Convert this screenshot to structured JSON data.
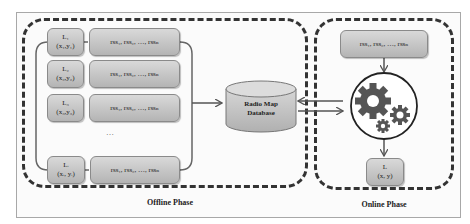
{
  "offline": {
    "label": "Offline Phase",
    "rows": [
      {
        "loc": "L₁",
        "coord": "(x₁,y₁)",
        "rss": "rss₁, rss₂, …, rssₙ"
      },
      {
        "loc": "L₂",
        "coord": "(x₂,y₂)",
        "rss": "rss₁, rss₂, …, rssₙ"
      },
      {
        "loc": "L₃",
        "coord": "(x₃,y₃)",
        "rss": "rss₁, rss₂, …, rssₙ"
      },
      {
        "loc": "Lᵢ",
        "coord": "(xᵢ, yᵢ)",
        "rss": "rss₁, rss₂, …, rssₙ"
      }
    ],
    "ellipsis": "…"
  },
  "database": {
    "line1": "Radio Map",
    "line2": "Database"
  },
  "online": {
    "label": "Online Phase",
    "rss": "rss₁, rss₂, …, rssₙ",
    "processor_icon": "gears-icon",
    "result_loc": "L",
    "result_coord": "(x, y)"
  },
  "colors": {
    "box_top": "#d9d9d9",
    "box_bottom": "#b4b4b4",
    "gear": "#555555",
    "line": "#555555"
  }
}
